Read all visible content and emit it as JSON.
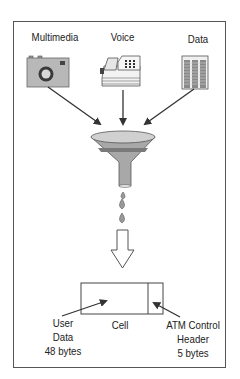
{
  "diagram": {
    "sources": [
      {
        "label": "Multimedia",
        "icon": "camera-icon"
      },
      {
        "label": "Voice",
        "icon": "telephone-fax-icon"
      },
      {
        "label": "Data",
        "icon": "data-document-icon"
      }
    ],
    "funnel": {
      "icon": "funnel-icon"
    },
    "drops": 3,
    "cell": {
      "label": "Cell",
      "payload": {
        "line1": "User",
        "line2": "Data",
        "line3": "48 bytes"
      },
      "header": {
        "line1": "ATM Control",
        "line2": "Header",
        "line3": "5 bytes"
      }
    },
    "colors": {
      "icon_fill": "#b4b4b4",
      "icon_dark": "#4a4a4a",
      "funnel_fill": "#a8a8a8",
      "stroke": "#333333",
      "frame": "#555555"
    }
  }
}
